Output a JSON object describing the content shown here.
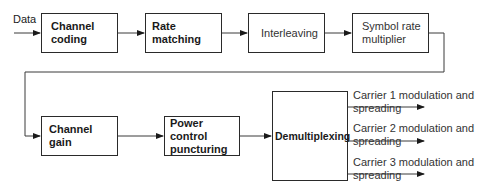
{
  "diagram": {
    "input_label": "Data",
    "blocks": [
      {
        "id": "channel_coding",
        "label": "Channel\ncoding",
        "bold": true
      },
      {
        "id": "rate_matching",
        "label": "Rate matching",
        "bold": true
      },
      {
        "id": "interleaving",
        "label": "Interleaving",
        "bold": false
      },
      {
        "id": "symbol_rate_multiplier",
        "label": "Symbol rate\nmultiplier",
        "bold": false
      },
      {
        "id": "channel_gain",
        "label": "Channel gain",
        "bold": true
      },
      {
        "id": "power_control_puncturing",
        "label": "Power control\npuncturing",
        "bold": true
      },
      {
        "id": "demultiplexing",
        "label": "Demultiplexing",
        "bold": true
      }
    ],
    "outputs": [
      {
        "label": "Carrier 1 modulation and\nspreading"
      },
      {
        "label": "Carrier 2 modulation and\nspreading"
      },
      {
        "label": "Carrier 3 modulation and\nspreading"
      }
    ]
  }
}
